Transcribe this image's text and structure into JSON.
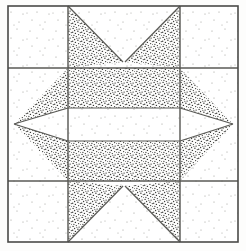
{
  "image": {
    "title": "Quilt Block Diagram",
    "subject": "Sawtooth Star quilt block",
    "width": 246,
    "height": 251,
    "background_color": "#fdfdfc"
  },
  "block": {
    "name": "sawtooth-star-block",
    "grid_columns": 3,
    "grid_rows": 3,
    "outer_border": {
      "left": 8,
      "top": 6,
      "right": 238,
      "bottom": 242,
      "stroke_color": "#4a4a48",
      "stroke_width": 1.6
    },
    "grid_lines": {
      "vertical_x": [
        68,
        180
      ],
      "horizontal_y": [
        68,
        181
      ],
      "stroke_color": "#5a5a56",
      "stroke_width": 1.3
    },
    "center_panel": {
      "left": 68,
      "top": 108,
      "right": 180,
      "bottom": 141,
      "fill": "light-stipple",
      "stroke_color": "#4a4a48"
    },
    "fabrics": [
      {
        "id": "light-stipple",
        "label": "Light background fabric",
        "base_color": "#ffffff",
        "dot_color": "#8a8a86",
        "density": "sparse"
      },
      {
        "id": "dark-stipple",
        "label": "Dark print fabric",
        "base_color": "#fbfbfa",
        "dot_color": "#3b3b39",
        "density": "dense"
      }
    ],
    "pieces": [
      {
        "name": "corner-square-top-left",
        "fabric": "light-stipple",
        "shape": "square",
        "position": "top-left"
      },
      {
        "name": "corner-square-top-right",
        "fabric": "light-stipple",
        "shape": "square",
        "position": "top-right"
      },
      {
        "name": "corner-square-bottom-left",
        "fabric": "light-stipple",
        "shape": "square",
        "position": "bottom-left"
      },
      {
        "name": "corner-square-bottom-right",
        "fabric": "light-stipple",
        "shape": "square",
        "position": "bottom-right"
      },
      {
        "name": "star-point-top-left",
        "fabric": "dark-stipple",
        "shape": "triangle",
        "position": "top-center"
      },
      {
        "name": "star-point-top-right",
        "fabric": "dark-stipple",
        "shape": "triangle",
        "position": "top-center"
      },
      {
        "name": "star-point-left-upper",
        "fabric": "dark-stipple",
        "shape": "triangle",
        "position": "middle-left"
      },
      {
        "name": "star-point-left-lower",
        "fabric": "dark-stipple",
        "shape": "triangle",
        "position": "middle-left"
      },
      {
        "name": "star-point-right-upper",
        "fabric": "dark-stipple",
        "shape": "triangle",
        "position": "middle-right"
      },
      {
        "name": "star-point-right-lower",
        "fabric": "dark-stipple",
        "shape": "triangle",
        "position": "middle-right"
      },
      {
        "name": "star-point-bottom-left",
        "fabric": "dark-stipple",
        "shape": "triangle",
        "position": "bottom-center"
      },
      {
        "name": "star-point-bottom-right",
        "fabric": "dark-stipple",
        "shape": "triangle",
        "position": "bottom-center"
      },
      {
        "name": "center-upper-band",
        "fabric": "dark-stipple",
        "shape": "rectangle",
        "position": "center"
      },
      {
        "name": "center-white-band",
        "fabric": "light-stipple",
        "shape": "rectangle",
        "position": "center"
      },
      {
        "name": "center-lower-band",
        "fabric": "dark-stipple",
        "shape": "rectangle",
        "position": "center"
      }
    ]
  }
}
